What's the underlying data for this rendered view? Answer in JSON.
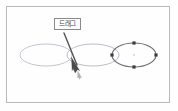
{
  "figure": {
    "kind": "scanned-illustration",
    "background_color": "#fefefe",
    "width": 178,
    "height": 111,
    "frame": {
      "name": "figure-border",
      "x": 6,
      "y": 6,
      "width": 164,
      "height": 97,
      "stroke_color": "#b9b9b9",
      "stroke_width": 1
    },
    "callout": {
      "label": "드래그",
      "box": {
        "x": 54,
        "y": 17.5,
        "width": 27,
        "height": 12,
        "border_color": "#8a8a8a",
        "fill_color": "#fdfdfd",
        "text_color": "#4a4a4a"
      },
      "leader_line": {
        "name": "callout-arrow",
        "from_x": 64,
        "from_y": 33,
        "to_x": 78,
        "to_y": 68,
        "stroke_color": "#555555",
        "stroke_width": 1.4
      },
      "cursor": {
        "name": "mouse-cursor",
        "tip_x": 78,
        "tip_y": 66,
        "color": "#4a4a4a",
        "ghost_color": "#b0b0b0"
      }
    },
    "ellipses": [
      {
        "name": "ellipse-first",
        "cx": 46,
        "cy": 55,
        "rx": 26,
        "ry": 11,
        "stroke_color": "#c8c3cf",
        "stroke_width": 1,
        "selected": false
      },
      {
        "name": "ellipse-second",
        "cx": 93,
        "cy": 55,
        "rx": 26,
        "ry": 11,
        "stroke_color": "#c0bcc8",
        "stroke_width": 1,
        "selected": false
      },
      {
        "name": "ellipse-third-selected",
        "cx": 134,
        "cy": 55,
        "rx": 22,
        "ry": 12,
        "stroke_color": "#6f6f6f",
        "stroke_width": 1.1,
        "selected": true,
        "handle_color": "#3c3c3c",
        "center_dot_color": "#aaaaaa",
        "handles": [
          {
            "name": "handle-top",
            "x": 134,
            "y": 43
          },
          {
            "name": "handle-bottom",
            "x": 134,
            "y": 67
          },
          {
            "name": "handle-left",
            "x": 112,
            "y": 55
          },
          {
            "name": "handle-right",
            "x": 156,
            "y": 55
          }
        ]
      }
    ]
  }
}
